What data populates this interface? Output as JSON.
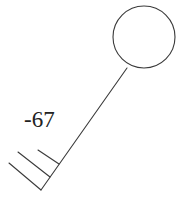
{
  "diagram": {
    "type": "station-model-wind-barb",
    "value_label": "-67",
    "barb_count": 3,
    "colors": {
      "stroke": "#3a3a3a",
      "text": "#222222",
      "background": "#ffffff"
    }
  }
}
